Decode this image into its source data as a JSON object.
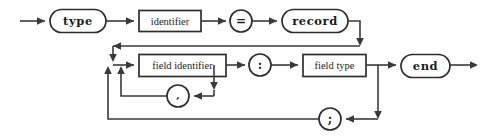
{
  "diagram": {
    "kind": "railroad-syntax-diagram",
    "canvas": {
      "width": 491,
      "height": 140,
      "background": "#ffffff"
    },
    "colors": {
      "line": "#3a3a3a",
      "node_stroke": "#2e2e2e",
      "node_fill": "#ffffff",
      "text": "#1c1c1c"
    },
    "nodes": [
      {
        "id": "kw-type",
        "shape": "stadium",
        "role": "terminal-keyword",
        "label": "type",
        "x": 50,
        "y": 9,
        "w": 56,
        "h": 23
      },
      {
        "id": "nt-identifier",
        "shape": "rect",
        "role": "nonterminal",
        "label": "identifier",
        "x": 139,
        "y": 10,
        "w": 62,
        "h": 21
      },
      {
        "id": "op-equals",
        "shape": "circle",
        "role": "terminal-punct",
        "label": "=",
        "cx": 241,
        "cy": 21,
        "r": 11
      },
      {
        "id": "kw-record",
        "shape": "stadium",
        "role": "terminal-keyword",
        "label": "record",
        "x": 282,
        "y": 9,
        "w": 66,
        "h": 23
      },
      {
        "id": "nt-field-identifier",
        "shape": "rect",
        "role": "nonterminal",
        "label": "field identifier",
        "x": 139,
        "y": 54,
        "w": 87,
        "h": 22
      },
      {
        "id": "op-colon",
        "shape": "circle",
        "role": "terminal-punct",
        "label": ":",
        "cx": 260,
        "cy": 65,
        "r": 11
      },
      {
        "id": "nt-field-type",
        "shape": "rect",
        "role": "nonterminal",
        "label": "field type",
        "x": 303,
        "y": 54,
        "w": 63,
        "h": 22
      },
      {
        "id": "kw-end",
        "shape": "stadium",
        "role": "terminal-keyword",
        "label": "end",
        "x": 401,
        "y": 54,
        "w": 49,
        "h": 23
      },
      {
        "id": "op-comma",
        "shape": "circle",
        "role": "terminal-punct",
        "label": ",",
        "cx": 178,
        "cy": 96,
        "r": 11
      },
      {
        "id": "op-semicolon",
        "shape": "circle",
        "role": "terminal-punct",
        "label": ";",
        "cx": 330,
        "cy": 119,
        "r": 11
      }
    ],
    "grammar": "type identifier = record { field identifier { , field identifier } : field type { ; ... } } end",
    "entry_label": "entry",
    "exit_label": "exit"
  }
}
